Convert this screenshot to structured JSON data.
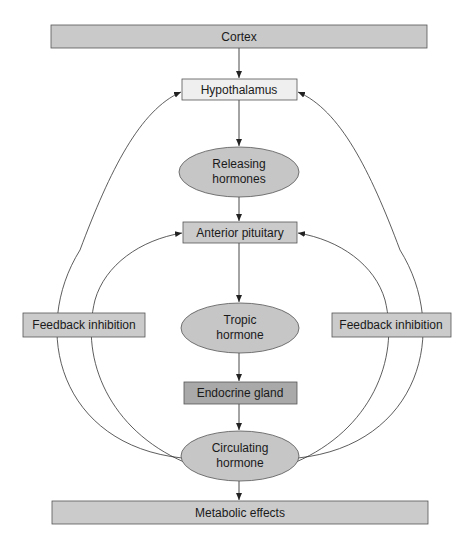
{
  "diagram": {
    "nodes": {
      "cortex": {
        "label": "Cortex",
        "shape": "rect",
        "fill": "#c9c9c9"
      },
      "hypothalamus": {
        "label": "Hypothalamus",
        "shape": "rect",
        "fill": "#efefef"
      },
      "releasing_hormones": {
        "label_line1": "Releasing",
        "label_line2": "hormones",
        "shape": "ellipse",
        "fill": "#c6c6c6"
      },
      "anterior_pituitary": {
        "label": "Anterior pituitary",
        "shape": "rect",
        "fill": "#cbcbcb"
      },
      "tropic_hormone": {
        "label_line1": "Tropic",
        "label_line2": "hormone",
        "shape": "ellipse",
        "fill": "#c6c6c6"
      },
      "endocrine_gland": {
        "label": "Endocrine gland",
        "shape": "rect",
        "fill": "#a9a9a9"
      },
      "circulating_hormone": {
        "label_line1": "Circulating",
        "label_line2": "hormone",
        "shape": "ellipse",
        "fill": "#c6c6c6"
      },
      "metabolic_effects": {
        "label": "Metabolic effects",
        "shape": "rect",
        "fill": "#cbcbcb"
      },
      "feedback_left": {
        "label": "Feedback inhibition",
        "shape": "rect",
        "fill": "#cbcbcb"
      },
      "feedback_right": {
        "label": "Feedback inhibition",
        "shape": "rect",
        "fill": "#cbcbcb"
      }
    },
    "edges": [
      {
        "from": "Cortex",
        "to": "Hypothalamus"
      },
      {
        "from": "Hypothalamus",
        "to": "Releasing hormones"
      },
      {
        "from": "Releasing hormones",
        "to": "Anterior pituitary"
      },
      {
        "from": "Anterior pituitary",
        "to": "Tropic hormone"
      },
      {
        "from": "Tropic hormone",
        "to": "Endocrine gland"
      },
      {
        "from": "Endocrine gland",
        "to": "Circulating hormone"
      },
      {
        "from": "Circulating hormone",
        "to": "Metabolic effects"
      },
      {
        "from": "Circulating hormone",
        "to": "Hypothalamus",
        "via": "Feedback inhibition"
      },
      {
        "from": "Circulating hormone",
        "to": "Anterior pituitary",
        "via": "Feedback inhibition"
      }
    ],
    "colors": {
      "stroke": "#4a4a4a",
      "line": "#333333",
      "background": "#ffffff"
    }
  }
}
